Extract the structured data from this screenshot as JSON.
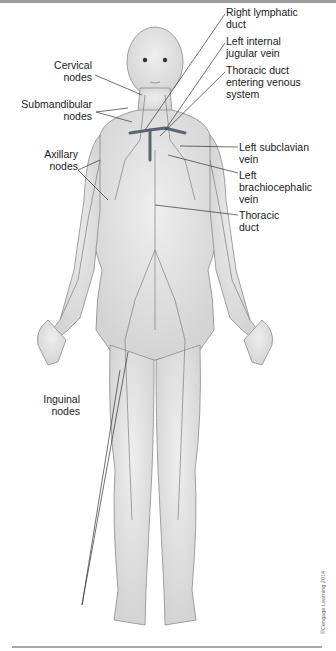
{
  "figure": {
    "labels_left": [
      {
        "id": "cervical-nodes",
        "text": "Cervical\nnodes"
      },
      {
        "id": "submandibular-nodes",
        "text": "Submandibular\nnodes"
      },
      {
        "id": "axillary-nodes",
        "text": "Axillary\nnodes"
      },
      {
        "id": "inguinal-nodes",
        "text": "Inguinal\nnodes"
      }
    ],
    "labels_right": [
      {
        "id": "right-lymphatic-duct",
        "text": "Right lymphatic\nduct"
      },
      {
        "id": "left-internal-jugular-vein",
        "text": "Left internal\njugular vein"
      },
      {
        "id": "thoracic-duct-entering-venous-system",
        "text": "Thoracic duct\nentering venous\nsystem"
      },
      {
        "id": "left-subclavian-vein",
        "text": "Left subclavian\nvein"
      },
      {
        "id": "left-brachiocephalic-vein",
        "text": "Left\nbrachiocephalic\nvein"
      },
      {
        "id": "thoracic-duct",
        "text": "Thoracic\nduct"
      }
    ],
    "copyright": "©Cengage Learning 2014",
    "colors": {
      "skin": "#e6e6e6",
      "outline": "#8c8c8c",
      "vessel": "#7a7f86",
      "leader": "#333333"
    }
  }
}
